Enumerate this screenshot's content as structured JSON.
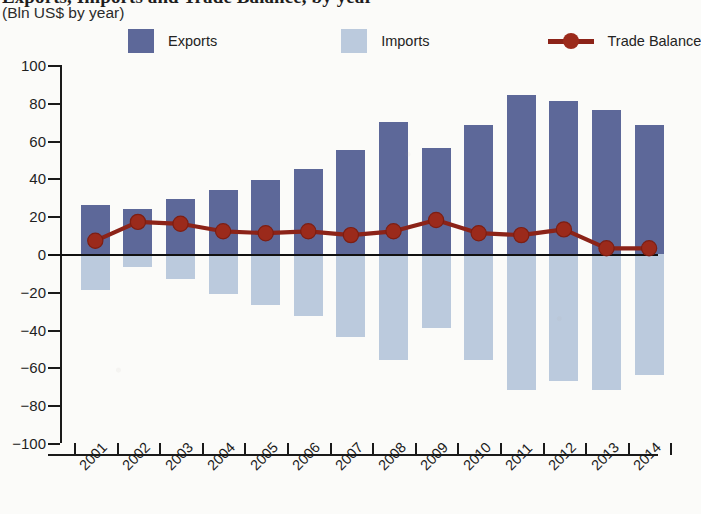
{
  "header": {
    "title": "Exports, Imports and Trade Balance, by year",
    "subtitle": "(Bln US$ by year)"
  },
  "legend": {
    "position": "top",
    "items": [
      {
        "label": "Exports",
        "type": "swatch",
        "color": "#5d6899",
        "icon": "square-swatch-icon"
      },
      {
        "label": "Imports",
        "type": "swatch",
        "color": "#bbcadd",
        "icon": "square-swatch-icon"
      },
      {
        "label": "Trade Balance",
        "type": "line",
        "color": "#8c2318",
        "icon": "line-marker-icon"
      }
    ]
  },
  "axes": {
    "ylabel": "",
    "xlabel": "",
    "yticks": [
      100,
      80,
      60,
      40,
      20,
      0,
      -20,
      -40,
      -60,
      -80,
      -100
    ],
    "ytick_labels": [
      "100",
      "80",
      "60",
      "40",
      "20",
      "0",
      "−20",
      "−40",
      "−60",
      "−80",
      "−100"
    ],
    "ylim": [
      -100,
      100
    ],
    "grid": false
  },
  "chart_data": {
    "type": "bar",
    "title": "Exports, Imports and Trade Balance, by year",
    "subtitle": "(Bln US$ by year)",
    "xlabel": "",
    "ylabel": "Bln US$",
    "ylim": [
      -100,
      100
    ],
    "grid": false,
    "legend_position": "top",
    "categories": [
      "2001",
      "2002",
      "2003",
      "2004",
      "2005",
      "2006",
      "2007",
      "2008",
      "2009",
      "2010",
      "2011",
      "2012",
      "2013",
      "2014"
    ],
    "series": [
      {
        "name": "Exports",
        "type": "bar",
        "color": "#5d6899",
        "values": [
          26,
          24,
          29,
          34,
          39,
          45,
          55,
          70,
          56,
          68,
          84,
          81,
          76,
          68
        ]
      },
      {
        "name": "Imports",
        "type": "bar",
        "color": "#bbcadd",
        "values": [
          -19,
          -7,
          -13,
          -21,
          -27,
          -33,
          -44,
          -56,
          -39,
          -56,
          -72,
          -67,
          -72,
          -64
        ]
      },
      {
        "name": "Trade Balance",
        "type": "line",
        "color": "#8c2318",
        "marker": "circle",
        "values": [
          7,
          17,
          16,
          12,
          11,
          12,
          10,
          12,
          18,
          11,
          10,
          13,
          3,
          3
        ]
      }
    ]
  }
}
